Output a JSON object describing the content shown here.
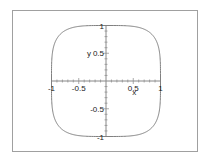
{
  "chart_data": {
    "type": "line",
    "title": "",
    "xlabel": "x",
    "ylabel": "y",
    "xlim": [
      -1,
      1
    ],
    "ylim": [
      -1,
      1
    ],
    "grid": false,
    "legend": null,
    "x_ticks": [
      -1,
      -0.5,
      0.5,
      1
    ],
    "y_ticks": [
      1,
      0.5,
      -0.5,
      -1
    ],
    "x_tick_labels": [
      "-1",
      "-0.5",
      "0.5",
      "1"
    ],
    "y_tick_labels": [
      "1",
      "0.5",
      "-0.5",
      "-1"
    ],
    "series": [
      {
        "name": "superellipse |x|^4 + |y|^4 = 1",
        "exponent": 4,
        "color": "#808080",
        "points_sample": [
          [
            1,
            0
          ],
          [
            0.84,
            0.84
          ],
          [
            0,
            1
          ],
          [
            -0.84,
            0.84
          ],
          [
            -1,
            0
          ],
          [
            -0.84,
            -0.84
          ],
          [
            0,
            -1
          ],
          [
            0.84,
            -0.84
          ]
        ]
      }
    ],
    "axes_style": "cross through origin"
  },
  "colors": {
    "frame": "#a0a0a0",
    "axis": "#888888",
    "curve": "#808080",
    "text": "#222222"
  },
  "layout": {
    "origin_px": [
      106,
      81
    ],
    "x_unit_px": 54.5,
    "y_unit_px": 55.5
  }
}
